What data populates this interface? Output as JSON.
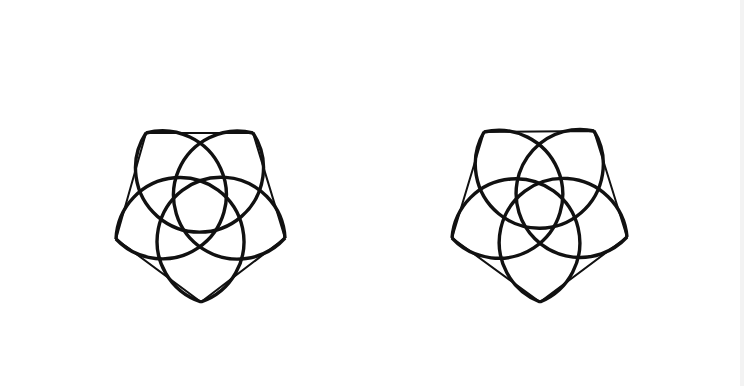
{
  "figure": {
    "stroke_color": "#111111",
    "background": "#ffffff",
    "petal_radius": 64,
    "petal_stroke_width": 3.4,
    "pentagon_stroke_width": 2,
    "shapes": [
      {
        "name": "left-flower",
        "vertices": [
          [
            146,
            133
          ],
          [
            253,
            133
          ],
          [
            285,
            238
          ],
          [
            201,
            302
          ],
          [
            116,
            239
          ]
        ]
      },
      {
        "name": "right-flower",
        "vertices": [
          [
            484,
            132
          ],
          [
            594,
            131
          ],
          [
            627,
            237
          ],
          [
            540,
            302
          ],
          [
            452,
            238
          ]
        ]
      }
    ]
  }
}
